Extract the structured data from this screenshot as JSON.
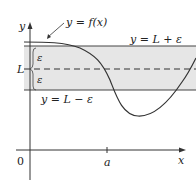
{
  "figure": {
    "curve_label": "y = f(x)",
    "upper_label": "y = L + ε",
    "lower_label": "y = L − ε",
    "L_label": "L",
    "epsilon_top": "ε",
    "epsilon_bottom": "ε",
    "y_axis_label": "y",
    "x_axis_label": "x",
    "origin_label": "0",
    "a_label": "a",
    "colors": {
      "band": "#e6e6e6",
      "line": "#333333"
    }
  }
}
